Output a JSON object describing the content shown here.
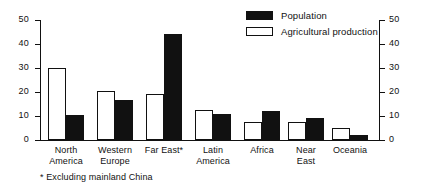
{
  "chart_data": {
    "type": "bar",
    "title": "",
    "subtitle": "",
    "xlabel": "",
    "ylabel": "",
    "ylim": [
      0,
      50
    ],
    "yticks": [
      0,
      10,
      20,
      30,
      40,
      50
    ],
    "grid": false,
    "dual_axis": true,
    "right_axis_ticks": [
      0,
      10,
      20,
      30,
      40,
      50
    ],
    "legend_position": "top-right",
    "categories": [
      "North\nAmerica",
      "Western\nEurope",
      "Far East*",
      "Latin\nAmerica",
      "Africa",
      "Near\nEast",
      "Oceania"
    ],
    "series": [
      {
        "name": "Agricultural production",
        "style": "hollow",
        "values": [
          30,
          20.5,
          19.3,
          12.7,
          7.5,
          7.3,
          5
        ]
      },
      {
        "name": "Population",
        "style": "filled",
        "values": [
          10.5,
          16.5,
          44.3,
          11,
          12.2,
          9,
          2
        ]
      }
    ],
    "annotations": [
      "* Excluding mainland China"
    ],
    "colors": {
      "population": "#111111",
      "agricultural_production": "#ffffff",
      "axis": "#111111",
      "background": "#ffffff"
    }
  },
  "legend": {
    "items": [
      {
        "label": "Population",
        "swatch": "filled"
      },
      {
        "label": "Agricultural production",
        "swatch": "hollow"
      }
    ]
  },
  "axis": {
    "left_labels": [
      "50",
      "40",
      "30",
      "20",
      "10",
      "0"
    ],
    "right_labels": [
      "50",
      "40",
      "30",
      "20",
      "10",
      "0"
    ]
  },
  "footnote": {
    "text": "* Excluding mainland China"
  }
}
